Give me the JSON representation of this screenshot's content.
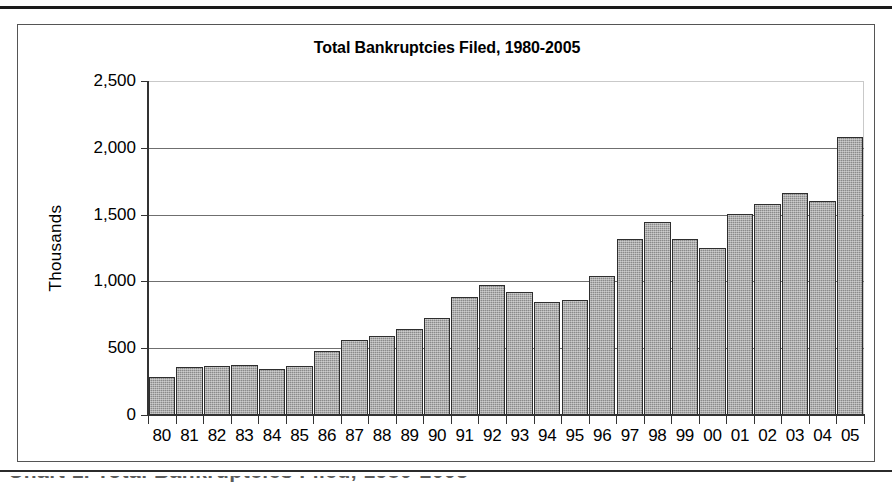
{
  "page": {
    "caption_partial": "Chart 1.  Total Bankruptcies Filed, 1980-2005"
  },
  "chart_data": {
    "type": "bar",
    "title": "Total Bankruptcies Filed, 1980-2005",
    "xlabel": "",
    "ylabel": "Thousands",
    "ylim": [
      0,
      2500
    ],
    "ytick_labels": [
      "2,500",
      "2,000",
      "1,500",
      "1,000",
      "500",
      "0"
    ],
    "ytick_values": [
      2500,
      2000,
      1500,
      1000,
      500,
      0
    ],
    "grid": true,
    "legend": "none",
    "bar_color": "#8a8a8a",
    "bar_border_color": "#2e2e2e",
    "gridline_color": "#6f6f6f",
    "axis_color": "#333333",
    "categories": [
      "80",
      "81",
      "82",
      "83",
      "84",
      "85",
      "86",
      "87",
      "88",
      "89",
      "90",
      "91",
      "92",
      "93",
      "94",
      "95",
      "96",
      "97",
      "98",
      "99",
      "00",
      "01",
      "02",
      "03",
      "04",
      "05"
    ],
    "values": [
      287,
      360,
      368,
      374,
      344,
      365,
      477,
      561,
      594,
      643,
      725,
      880,
      973,
      919,
      845,
      858,
      1042,
      1317,
      1443,
      1320,
      1253,
      1504,
      1577,
      1661,
      1604,
      2078
    ]
  }
}
